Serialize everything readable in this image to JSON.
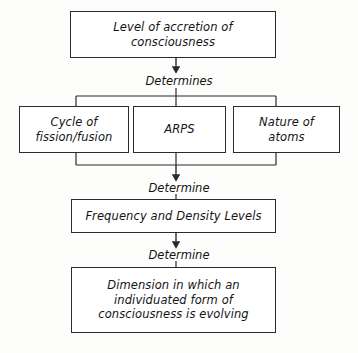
{
  "diagram": {
    "background_color": "#fdfdfc",
    "line_color": "#2b2b2b",
    "text_color": "#141414",
    "nodes": {
      "top": {
        "line1": "Level of accretion of",
        "line2": "consciousness"
      },
      "cycle": {
        "line1": "Cycle of",
        "line2": "fission/fusion"
      },
      "arps": {
        "line1": "ARPS"
      },
      "nature": {
        "line1": "Nature of",
        "line2": "atoms"
      },
      "frequency": {
        "line1": "Frequency and Density Levels"
      },
      "dimension": {
        "line1": "Dimension in which an",
        "line2": "individuated form of",
        "line3": "consciousness is evolving"
      }
    },
    "connectors": {
      "determines": "Determines",
      "determine_1": "Determine",
      "determine_2": "Determine"
    }
  }
}
